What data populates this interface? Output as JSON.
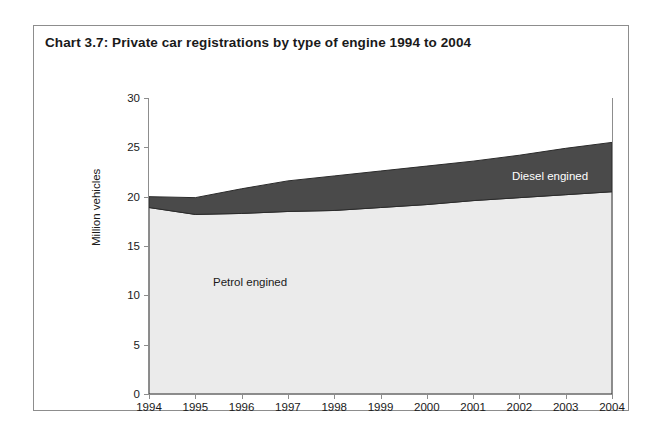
{
  "figure": {
    "title": "Chart 3.7:  Private car registrations by type of engine 1994 to 2004"
  },
  "axes": {
    "ylabel": "Million vehicles",
    "y_ticks": [
      "0",
      "5",
      "10",
      "15",
      "20",
      "25",
      "30"
    ],
    "x_ticks": [
      "1994",
      "1995",
      "1996",
      "1997",
      "1998",
      "1999",
      "2000",
      "2001",
      "2002",
      "2003",
      "2004"
    ]
  },
  "labels": {
    "petrol": "Petrol engined",
    "diesel": "Diesel engined"
  },
  "colors": {
    "petrol_fill": "#ebebeb",
    "diesel_fill": "#4a4a4a",
    "series_outline": "#2b2b2b",
    "axis": "#8d8d8d",
    "frame": "#8d8d8d",
    "text": "#1a1a1a"
  },
  "chart_data": {
    "type": "area",
    "stacked": true,
    "title": "Chart 3.7:  Private car registrations by type of engine 1994 to 2004",
    "xlabel": "",
    "ylabel": "Million vehicles",
    "x": [
      1994,
      1995,
      1996,
      1997,
      1998,
      1999,
      2000,
      2001,
      2002,
      2003,
      2004
    ],
    "categories": [
      "1994",
      "1995",
      "1996",
      "1997",
      "1998",
      "1999",
      "2000",
      "2001",
      "2002",
      "2003",
      "2004"
    ],
    "series": [
      {
        "name": "Petrol engined",
        "color": "#ebebeb",
        "values": [
          18.9,
          18.2,
          18.3,
          18.5,
          18.6,
          18.9,
          19.2,
          19.6,
          19.9,
          20.2,
          20.5
        ]
      },
      {
        "name": "Diesel engined",
        "color": "#4a4a4a",
        "values": [
          1.1,
          1.7,
          2.5,
          3.1,
          3.5,
          3.7,
          3.9,
          4.0,
          4.3,
          4.7,
          5.0
        ]
      }
    ],
    "cumulative_totals": [
      20.0,
      19.9,
      20.8,
      21.6,
      22.1,
      22.6,
      23.1,
      23.6,
      24.2,
      24.9,
      25.5
    ],
    "ylim": [
      0,
      30
    ],
    "ytick_step": 5,
    "grid": false,
    "legend": "inline-annotations"
  }
}
